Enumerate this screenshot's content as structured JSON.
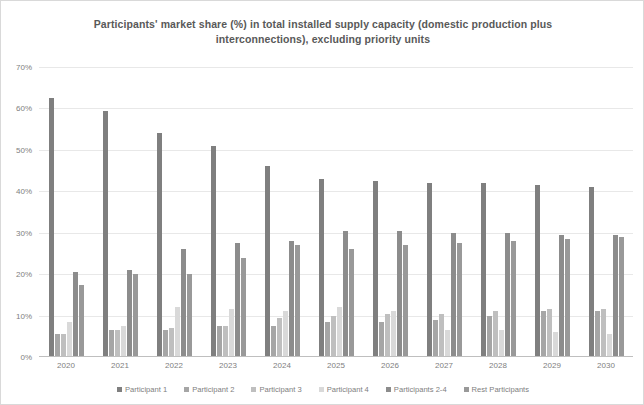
{
  "chart_data": {
    "type": "bar",
    "title": "Participants' market share (%) in total installed supply capacity (domestic production plus interconnections), excluding priority units",
    "xlabel": "",
    "ylabel": "",
    "ylim": [
      0,
      70
    ],
    "ytick_labels": [
      "0%",
      "10%",
      "20%",
      "30%",
      "40%",
      "50%",
      "60%",
      "70%"
    ],
    "ytick_values": [
      0,
      10,
      20,
      30,
      40,
      50,
      60,
      70
    ],
    "grid": true,
    "legend_position": "bottom",
    "categories": [
      "2020",
      "2021",
      "2022",
      "2023",
      "2024",
      "2025",
      "2026",
      "2027",
      "2028",
      "2029",
      "2030"
    ],
    "series": [
      {
        "name": "Participant 1",
        "color": "#7f7f7f",
        "values": [
          62.5,
          59.5,
          54.0,
          51.0,
          46.0,
          43.0,
          42.5,
          42.0,
          42.0,
          41.5,
          41.0
        ]
      },
      {
        "name": "Participant 2",
        "color": "#a6a6a6",
        "values": [
          5.5,
          6.5,
          6.5,
          7.5,
          7.5,
          8.5,
          8.5,
          9.0,
          10.0,
          11.0,
          11.0
        ]
      },
      {
        "name": "Participant 3",
        "color": "#bfbfbf",
        "values": [
          5.5,
          6.5,
          7.0,
          7.5,
          9.5,
          10.0,
          10.5,
          10.5,
          11.0,
          11.5,
          11.5
        ]
      },
      {
        "name": "Participant 4",
        "color": "#d9d9d9",
        "values": [
          8.5,
          7.5,
          12.0,
          11.5,
          11.0,
          12.0,
          11.0,
          6.5,
          6.5,
          6.0,
          5.5
        ]
      },
      {
        "name": "Participants 2-4",
        "color": "#8c8c8c",
        "values": [
          20.5,
          21.0,
          26.0,
          27.5,
          28.0,
          30.5,
          30.5,
          30.0,
          30.0,
          29.5,
          29.5
        ]
      },
      {
        "name": "Rest Participants",
        "color": "#999999",
        "values": [
          17.5,
          20.0,
          20.0,
          24.0,
          27.0,
          26.0,
          27.0,
          27.5,
          28.0,
          28.5,
          29.0
        ]
      }
    ]
  }
}
